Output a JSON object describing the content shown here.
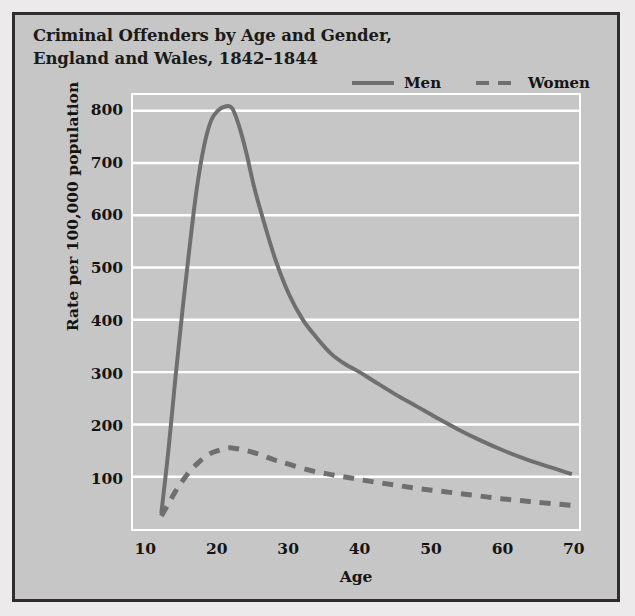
{
  "chart_data": {
    "type": "line",
    "title": "Criminal Offenders by Age and Gender, England and Wales, 1842–1844",
    "xlabel": "Age",
    "ylabel": "Rate per 100,000 population",
    "xlim": [
      8,
      71
    ],
    "ylim": [
      0,
      830
    ],
    "xticks": [
      10,
      20,
      30,
      40,
      50,
      60,
      70
    ],
    "yticks": [
      100,
      200,
      300,
      400,
      500,
      600,
      700,
      800
    ],
    "grid": "horizontal-white",
    "legend_position": "top-right",
    "colors": {
      "line": "#6f6f6f",
      "plot_background": "#c6c6c6",
      "figure_background": "#c6c6c6",
      "gridline": "#ffffff",
      "frame": "#2e2e2e",
      "text": "#141414"
    },
    "series": [
      {
        "name": "Men",
        "style": "solid",
        "x": [
          12,
          13,
          14,
          15,
          16,
          17,
          18,
          19,
          20,
          21,
          22,
          23,
          24,
          25,
          26,
          28,
          30,
          32,
          34,
          36,
          38,
          40,
          42,
          45,
          48,
          51,
          54,
          57,
          60,
          63,
          66,
          70
        ],
        "values": [
          30,
          150,
          290,
          420,
          540,
          650,
          730,
          780,
          800,
          808,
          805,
          770,
          720,
          660,
          610,
          520,
          450,
          400,
          365,
          335,
          315,
          300,
          283,
          258,
          235,
          212,
          190,
          170,
          152,
          136,
          122,
          105
        ]
      },
      {
        "name": "Women",
        "style": "dashed",
        "x": [
          12,
          13,
          14,
          15,
          16,
          17,
          18,
          19,
          20,
          21,
          22,
          24,
          26,
          28,
          30,
          33,
          36,
          39,
          42,
          45,
          48,
          51,
          54,
          57,
          60,
          63,
          66,
          70
        ],
        "values": [
          25,
          48,
          72,
          92,
          110,
          124,
          136,
          145,
          150,
          154,
          155,
          150,
          142,
          132,
          124,
          112,
          104,
          97,
          90,
          84,
          78,
          73,
          68,
          63,
          58,
          54,
          50,
          45
        ]
      }
    ]
  },
  "legend": {
    "items": [
      {
        "label": "Men",
        "style": "solid"
      },
      {
        "label": "Women",
        "style": "dashed"
      }
    ]
  }
}
